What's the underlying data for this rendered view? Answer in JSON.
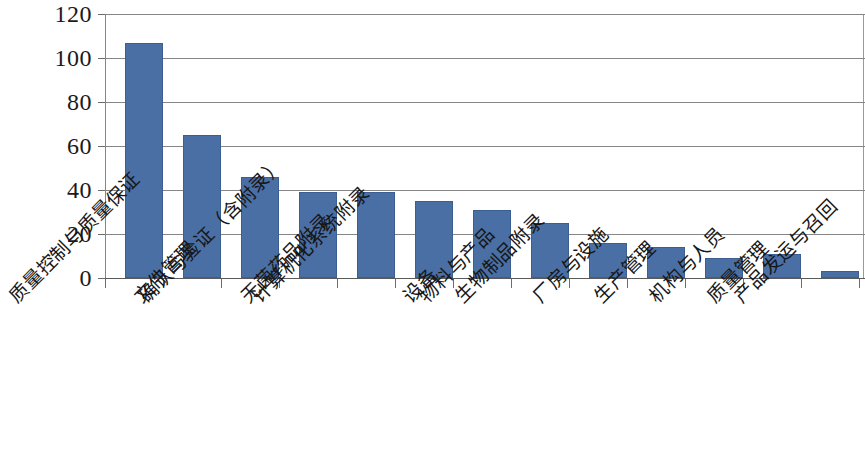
{
  "chart_data": {
    "type": "bar",
    "title": "",
    "xlabel": "",
    "ylabel": "",
    "ylim": [
      0,
      120
    ],
    "ytick_values": [
      0,
      20,
      40,
      60,
      80,
      100,
      120
    ],
    "ytick_labels": [
      "0",
      "20",
      "40",
      "60",
      "80",
      "100",
      "120"
    ],
    "grid": true,
    "legend": "none",
    "bar_color": "#4a6fa5",
    "gridline_color": "#868686",
    "categories": [
      "质量控制与质量保证",
      "文件管理",
      "确认与验证（含附录）",
      "无菌药品附录",
      "计算机化系统附录",
      "设备",
      "物料与产品",
      "生物制品附录",
      "厂房与设施",
      "生产管理",
      "机构与人员",
      "质量管理",
      "产品发运与召回"
    ],
    "values": [
      107,
      65,
      46,
      39,
      39,
      35,
      31,
      25,
      16,
      14,
      9,
      11,
      3
    ]
  }
}
